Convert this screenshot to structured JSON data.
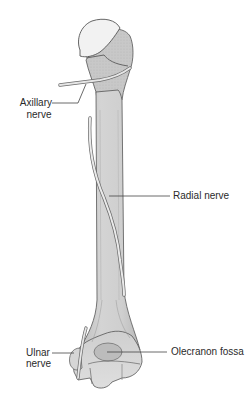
{
  "diagram": {
    "colors": {
      "background": "#ffffff",
      "bone_shaft": "#c9c9c9",
      "bone_shaft_light": "#dcdcdc",
      "humeral_head": "#f2f2f2",
      "outline": "#555555",
      "nerve_fill": "#e6e6e6",
      "nerve_outline": "#6a6a6a",
      "leader_line": "#444444",
      "label_text": "#2a2a2a"
    },
    "labels": {
      "axillary_line1": "Axillary",
      "axillary_line2": "nerve",
      "radial": "Radial nerve",
      "ulnar_line1": "Ulnar",
      "ulnar_line2": "nerve",
      "olecranon": "Olecranon fossa"
    }
  }
}
